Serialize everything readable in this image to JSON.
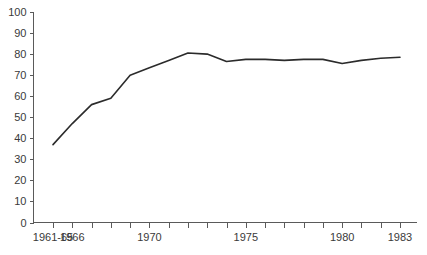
{
  "chart_data": {
    "type": "line",
    "title": "",
    "subtitle": "",
    "xlabel": "",
    "ylabel": "",
    "grid": false,
    "legend": false,
    "legend_position": "none",
    "line_color": "#2b2b2b",
    "axis_color": "#5a5a5a",
    "background_color": "#ffffff",
    "ylim": [
      0,
      100
    ],
    "y_ticks": [
      0,
      10,
      20,
      30,
      40,
      50,
      60,
      70,
      80,
      90,
      100
    ],
    "y_tick_labels": [
      "0",
      "10",
      "20",
      "30",
      "40",
      "50",
      "60",
      "70",
      "80",
      "90",
      "100"
    ],
    "categories": [
      "1961-65",
      "1966",
      "1967",
      "1968",
      "1969",
      "1970",
      "1971",
      "1972",
      "1973",
      "1974",
      "1975",
      "1976",
      "1977",
      "1978",
      "1979",
      "1980",
      "1981",
      "1982",
      "1983"
    ],
    "x_tick_labels_visible": [
      "1961-65",
      "1966",
      "1970",
      "1975",
      "1980",
      "1983"
    ],
    "x_tick_label_indices": [
      0,
      1,
      5,
      10,
      15,
      18
    ],
    "values": [
      37,
      47,
      56,
      59,
      70,
      73.5,
      77,
      80.5,
      80,
      76.5,
      77.5,
      77.5,
      77,
      77.5,
      77.5,
      75.5,
      77,
      78,
      78.5
    ],
    "series": [
      {
        "name": "series-1",
        "values": [
          37,
          47,
          56,
          59,
          70,
          73.5,
          77,
          80.5,
          80,
          76.5,
          77.5,
          77.5,
          77,
          77.5,
          77.5,
          75.5,
          77,
          78,
          78.5
        ]
      }
    ]
  }
}
